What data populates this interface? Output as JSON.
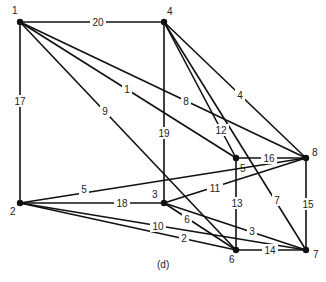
{
  "caption": "(d)",
  "colors": {
    "line": "#111111",
    "background": "#ffffff",
    "text": "#222222"
  },
  "nodes": [
    {
      "id": "1",
      "x": 20,
      "y": 22,
      "lx": 12,
      "ly": 14
    },
    {
      "id": "2",
      "x": 20,
      "y": 203,
      "lx": 10,
      "ly": 215
    },
    {
      "id": "3",
      "x": 164,
      "y": 203,
      "lx": 152,
      "ly": 198
    },
    {
      "id": "4",
      "x": 164,
      "y": 22,
      "lx": 167,
      "ly": 15
    },
    {
      "id": "5",
      "x": 236,
      "y": 158,
      "lx": 240,
      "ly": 172
    },
    {
      "id": "6",
      "x": 236,
      "y": 250,
      "lx": 229,
      "ly": 263
    },
    {
      "id": "7",
      "x": 306,
      "y": 250,
      "lx": 313,
      "ly": 258
    },
    {
      "id": "8",
      "x": 306,
      "y": 158,
      "lx": 312,
      "ly": 156
    }
  ],
  "edges": [
    {
      "from": "1",
      "to": "4",
      "label": "20",
      "lx": 98,
      "ly": 22
    },
    {
      "from": "1",
      "to": "2",
      "label": "17",
      "lx": 20,
      "ly": 101
    },
    {
      "from": "1",
      "to": "5",
      "label": "1",
      "lx": 127,
      "ly": 89
    },
    {
      "from": "1",
      "to": "8",
      "label": "8",
      "lx": 186,
      "ly": 101
    },
    {
      "from": "1",
      "to": "6",
      "label": "9",
      "lx": 105,
      "ly": 111
    },
    {
      "from": "4",
      "to": "3",
      "label": "19",
      "lx": 164,
      "ly": 133
    },
    {
      "from": "4",
      "to": "5",
      "label": "12",
      "lx": 221,
      "ly": 130
    },
    {
      "from": "4",
      "to": "7",
      "label": "7",
      "lx": 277,
      "ly": 200
    },
    {
      "from": "4",
      "to": "8",
      "label": "4",
      "lx": 240,
      "ly": 95
    },
    {
      "from": "2",
      "to": "8",
      "label": "5",
      "lx": 84,
      "ly": 189
    },
    {
      "from": "2",
      "to": "3",
      "label": "18",
      "lx": 122,
      "ly": 203
    },
    {
      "from": "2",
      "to": "7",
      "label": "10",
      "lx": 158,
      "ly": 226
    },
    {
      "from": "2",
      "to": "6",
      "label": "2",
      "lx": 184,
      "ly": 238
    },
    {
      "from": "3",
      "to": "8",
      "label": "11",
      "lx": 215,
      "ly": 188
    },
    {
      "from": "3",
      "to": "6",
      "label": "6",
      "lx": 187,
      "ly": 219
    },
    {
      "from": "3",
      "to": "7",
      "label": "3",
      "lx": 252,
      "ly": 231
    },
    {
      "from": "5",
      "to": "8",
      "label": "16",
      "lx": 269,
      "ly": 158
    },
    {
      "from": "5",
      "to": "6",
      "label": "13",
      "lx": 237,
      "ly": 203
    },
    {
      "from": "8",
      "to": "7",
      "label": "15",
      "lx": 308,
      "ly": 204
    },
    {
      "from": "6",
      "to": "7",
      "label": "14",
      "lx": 270,
      "ly": 250
    }
  ]
}
